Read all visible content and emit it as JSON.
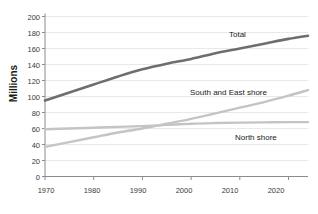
{
  "chart_data": {
    "type": "line",
    "title": "",
    "xlabel": "",
    "ylabel": "Millions",
    "xlim": [
      1970,
      2024
    ],
    "ylim": [
      0,
      200
    ],
    "grid": true,
    "legend_position": "inline-labels",
    "xticks": [
      "1970",
      "1980",
      "1990",
      "2000",
      "2010",
      "2020"
    ],
    "xtick_values": [
      1970,
      1980,
      1990,
      2000,
      2010,
      2020
    ],
    "yticks": [
      "0",
      "20",
      "40",
      "60",
      "80",
      "100",
      "120",
      "140",
      "160",
      "180",
      "200"
    ],
    "ytick_values": [
      0,
      20,
      40,
      60,
      80,
      100,
      120,
      140,
      160,
      180,
      200
    ],
    "x": [
      1970,
      1975,
      1980,
      1985,
      1990,
      1995,
      2000,
      2005,
      2010,
      2015,
      2020,
      2024
    ],
    "series": [
      {
        "name": "Total",
        "color": "#6e6e6e",
        "values": [
          95,
          105,
          115,
          125,
          134,
          141,
          147,
          154,
          160,
          166,
          172,
          176
        ]
      },
      {
        "name": "South and East shore",
        "color": "#c4c4c4",
        "values": [
          37,
          43,
          49,
          55,
          60,
          66,
          72,
          79,
          86,
          93,
          101,
          108
        ]
      },
      {
        "name": "North shore",
        "color": "#c4c4c4",
        "values": [
          59,
          60,
          61,
          62,
          63,
          64.5,
          66,
          66.8,
          67.3,
          67.7,
          68,
          68
        ]
      }
    ],
    "annotations": [
      {
        "text": "Total",
        "x": 2008,
        "y": 180
      },
      {
        "text": "South and East shore",
        "x": 1996,
        "y": 112
      },
      {
        "text": "North shore",
        "x": 2008,
        "y": 63
      }
    ]
  },
  "labels": {
    "y_axis_title": "Millions",
    "series_total": "Total",
    "series_south_east": "South and East shore",
    "series_north": "North shore",
    "y_0": "0",
    "y_20": "20",
    "y_40": "40",
    "y_60": "60",
    "y_80": "80",
    "y_100": "100",
    "y_120": "120",
    "y_140": "140",
    "y_160": "160",
    "y_180": "180",
    "y_200": "200",
    "x_1970": "1970",
    "x_1980": "1980",
    "x_1990": "1990",
    "x_2000": "2000",
    "x_2010": "2010",
    "x_2020": "2020"
  },
  "colors": {
    "total_line": "#6e6e6e",
    "shore_line": "#c4c4c4",
    "grid": "#e3e3e3",
    "axis": "#8c8c8c",
    "text": "#1a1a1a"
  }
}
